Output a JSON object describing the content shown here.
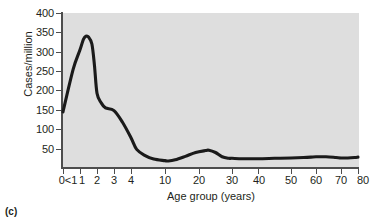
{
  "figure": {
    "panel_caption": "(c)",
    "background_color": "#dedede",
    "curve_color": "#1a1a1a",
    "axis_color": "#4d4d4d",
    "text_color": "#231f20"
  },
  "chart_data": {
    "type": "line",
    "title": "",
    "subtitle": "",
    "xlabel": "Age group (years)",
    "ylabel": "Cases/million",
    "grid": false,
    "legend": null,
    "xtick_labels": [
      "0<1",
      "1",
      "2",
      "3",
      "4",
      "10",
      "20",
      "30",
      "40",
      "50",
      "60",
      "70",
      "80"
    ],
    "xtick_values": [
      0.5,
      1,
      2,
      3,
      4,
      10,
      20,
      30,
      40,
      50,
      60,
      70,
      80
    ],
    "ytick_labels": [
      "50",
      "100",
      "150",
      "200",
      "250",
      "300",
      "350",
      "400"
    ],
    "ytick_values": [
      50,
      100,
      150,
      200,
      250,
      300,
      350,
      400
    ],
    "ylim": [
      0,
      400
    ],
    "xlim": [
      0.5,
      80
    ],
    "x_axis_scale": "piecewise (1-year steps to age 4, then 10-year steps)",
    "series": [
      {
        "name": "Cases/million",
        "x": [
          0.5,
          0.8,
          1.0,
          1.2,
          1.35,
          1.5,
          1.7,
          1.85,
          2.0,
          2.25,
          2.5,
          3.0,
          3.5,
          4.0,
          5.0,
          6.5,
          8.0,
          10.0,
          11.0,
          13.0,
          16.0,
          19.0,
          22.0,
          23.0,
          25.0,
          27.0,
          29.0,
          30.0,
          34.0,
          40.0,
          45.0,
          50.0,
          55.0,
          58.0,
          60.0,
          64.0,
          68.0,
          70.0,
          74.0,
          78.0,
          80.0
        ],
        "y": [
          145,
          255,
          305,
          332,
          340,
          338,
          320,
          265,
          193,
          168,
          155,
          148,
          118,
          78,
          48,
          32,
          23,
          19,
          18,
          21,
          30,
          40,
          45,
          46,
          40,
          29,
          25,
          25,
          24,
          24,
          25,
          26,
          27,
          28,
          29,
          29,
          27,
          26,
          26,
          27,
          28
        ]
      }
    ],
    "annotations": [
      {
        "text": "peak",
        "x": 1.4,
        "y": 340
      },
      {
        "text": "trough",
        "x": 11,
        "y": 18
      },
      {
        "text": "secondary bump",
        "x": 23,
        "y": 46
      }
    ]
  }
}
